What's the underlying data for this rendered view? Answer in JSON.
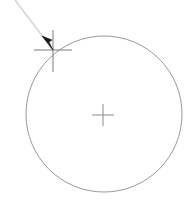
{
  "canvas": {
    "width": 193,
    "height": 215,
    "background_color": "#ffffff",
    "name": "cad-drawing-canvas"
  },
  "colors": {
    "circle_stroke": "#8c8c8c",
    "crosshair_stroke": "#8a8a8a",
    "cursor_crosshair_stroke": "#7a7a7a",
    "pointer_fill": "#1a1a1a",
    "guide_line_stroke": "#d6d6d6"
  },
  "shapes": {
    "circle": {
      "label": "circle",
      "center_x": 104,
      "center_y": 114,
      "radius": 78,
      "stroke_width": 1
    },
    "center_marker": {
      "label": "center-point-marker",
      "x": 103,
      "y": 115,
      "arm_half_length_x": 11,
      "arm_half_length_y": 11,
      "stroke_width": 1
    },
    "cursor_marker": {
      "label": "snap-point-marker",
      "x": 53,
      "y": 50,
      "arm_left": 19,
      "arm_right": 19,
      "arm_up": 20,
      "arm_down": 22,
      "stroke_width": 1
    },
    "guide_line": {
      "label": "leader-guide-line",
      "x1": 15,
      "y1": 0,
      "x2": 53,
      "y2": 50,
      "stroke_width": 1
    },
    "pointer": {
      "label": "mouse-pointer-arrow",
      "tip_x": 53,
      "tip_y": 50,
      "points": "42,36 53,50 49,42 52,40"
    }
  }
}
